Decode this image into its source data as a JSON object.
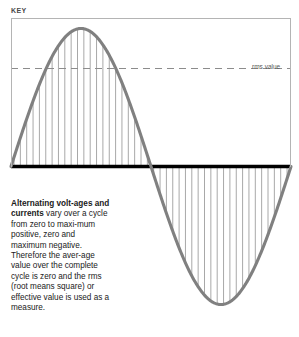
{
  "figure": {
    "key_label": "KEY",
    "rms_label": "rms value",
    "caption_lead": "Alternating volt-ages and currents",
    "caption_rest": " vary over a cycle from zero to maxi-mum positive, zero and maximum negative. Therefore the aver-age value over the complete cycle is zero and the rms (root means square) or effective value is used as a measure."
  },
  "chart_data": {
    "type": "line",
    "title": "KEY",
    "xlabel": "",
    "ylabel": "",
    "annotations": [
      "rms value"
    ],
    "series": [
      {
        "name": "alternating voltage / current",
        "description": "one full sine cycle, positive half then negative half",
        "color": "#808080",
        "x": [
          0,
          0.0625,
          0.125,
          0.1875,
          0.25,
          0.3125,
          0.375,
          0.4375,
          0.5,
          0.5625,
          0.625,
          0.6875,
          0.75,
          0.8125,
          0.875,
          0.9375,
          1
        ],
        "y": [
          0,
          0.383,
          0.707,
          0.924,
          1,
          0.924,
          0.707,
          0.383,
          0,
          -0.383,
          -0.707,
          -0.924,
          -1,
          -0.924,
          -0.707,
          -0.383,
          0
        ]
      }
    ],
    "reference_lines": [
      {
        "name": "zero-axis",
        "orientation": "horizontal",
        "value": 0,
        "style": "solid",
        "color": "#000000",
        "width": 3
      },
      {
        "name": "rms-value",
        "orientation": "horizontal",
        "value": 0.707,
        "style": "dashed",
        "color": "#8c8c8c",
        "label": "rms value"
      }
    ],
    "shading": {
      "style": "vertical-hatch",
      "color": "#a8a8a8",
      "description": "vertical lines filling the area between the curve and the zero axis for both half cycles"
    },
    "ylim": [
      -1.12,
      1.12
    ],
    "xlim": [
      0,
      1
    ],
    "grid": false,
    "legend": false
  }
}
